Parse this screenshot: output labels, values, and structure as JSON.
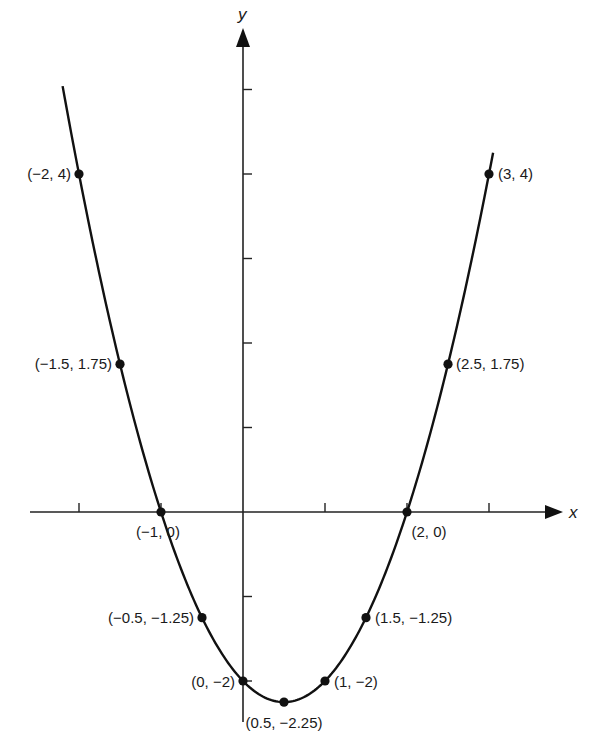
{
  "chart_data": {
    "type": "line",
    "title": "",
    "function": "y = x^2 - x - 2",
    "xlabel": "x",
    "ylabel": "y",
    "xlim": [
      -2.6,
      3.9
    ],
    "ylim": [
      -2.5,
      5.7
    ],
    "grid": false,
    "legend": null,
    "x_ticks": [
      -2,
      -1,
      1,
      2,
      3
    ],
    "y_ticks": [
      -2,
      -1,
      1,
      2,
      3,
      4,
      5
    ],
    "points": [
      {
        "x": -2,
        "y": 4,
        "label": "(−2, 4)"
      },
      {
        "x": -1.5,
        "y": 1.75,
        "label": "(−1.5, 1.75)"
      },
      {
        "x": -1,
        "y": 0,
        "label": "(−1, 0)"
      },
      {
        "x": -0.5,
        "y": -1.25,
        "label": "(−0.5, −1.25)"
      },
      {
        "x": 0,
        "y": -2,
        "label": "(0, −2)"
      },
      {
        "x": 0.5,
        "y": -2.25,
        "label": "(0.5, −2.25)"
      },
      {
        "x": 1,
        "y": -2,
        "label": "(1, −2)"
      },
      {
        "x": 1.5,
        "y": -1.25,
        "label": "(1.5, −1.25)"
      },
      {
        "x": 2,
        "y": 0,
        "label": "(2, 0)"
      },
      {
        "x": 2.5,
        "y": 1.75,
        "label": "(2.5, 1.75)"
      },
      {
        "x": 3,
        "y": 4,
        "label": "(3, 4)"
      }
    ],
    "curve_x_range": [
      -2.2,
      3.05
    ],
    "colors": {
      "line": "#111111",
      "axis": "#222222",
      "point": "#111111",
      "background": "#ffffff"
    }
  }
}
